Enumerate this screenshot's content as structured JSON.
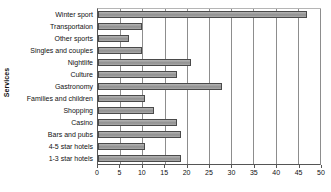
{
  "chart_data": {
    "type": "bar",
    "orientation": "horizontal",
    "title": "",
    "xlabel": "",
    "ylabel": "Services",
    "xlim": [
      0,
      50
    ],
    "xticks": [
      0,
      5,
      10,
      15,
      20,
      25,
      30,
      35,
      40,
      45,
      50
    ],
    "grid": true,
    "legend": false,
    "categories": [
      "Winter sport",
      "Transportaion",
      "Other sports",
      "Singles and couples",
      "Nightlife",
      "Culture",
      "Gastronomy",
      "Families and children",
      "Shopping",
      "Casino",
      "Bars and pubs",
      "4-5 star hotels",
      "1-3 star hotels"
    ],
    "values": [
      47,
      9.8,
      7,
      9.8,
      21,
      17.8,
      28,
      10.5,
      12.7,
      17.8,
      18.8,
      10.6,
      18.8
    ],
    "bar_fill_color": "#9e9e9e",
    "bar_border_color": "#4a4a4a",
    "gridline_color": "#8d8d8d",
    "axis_color": "#555555",
    "background_color": "#ffffff"
  }
}
